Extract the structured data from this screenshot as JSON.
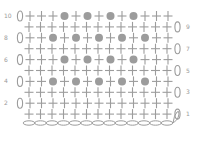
{
  "chart_data": {
    "type": "crochet-chart",
    "stitch_color": "#9c9c9c",
    "symbols": {
      "+": "single-crochet",
      "o": "bobble",
      "0": "chain",
      "c": "foundation-chain"
    },
    "rows": [
      {
        "number": "10",
        "label_side": "left",
        "turning_chain": "left",
        "stitches": "+++o+o+o+o+++"
      },
      {
        "number": "9",
        "label_side": "right",
        "turning_chain": "right",
        "stitches": "+++++++++++++"
      },
      {
        "number": "8",
        "label_side": "left",
        "turning_chain": "left",
        "stitches": "++o+o+o+o+o++"
      },
      {
        "number": "7",
        "label_side": "right",
        "turning_chain": "right",
        "stitches": "+++++++++++++"
      },
      {
        "number": "6",
        "label_side": "left",
        "turning_chain": "left",
        "stitches": "+++o+o+o+o+++"
      },
      {
        "number": "5",
        "label_side": "right",
        "turning_chain": "right",
        "stitches": "+++++++++++++"
      },
      {
        "number": "4",
        "label_side": "left",
        "turning_chain": "left",
        "stitches": "++o+o+o+o+o++"
      },
      {
        "number": "3",
        "label_side": "right",
        "turning_chain": "right",
        "stitches": "+++++++++++++"
      },
      {
        "number": "2",
        "label_side": "left",
        "turning_chain": "left",
        "stitches": "+++++++++++++"
      },
      {
        "number": "1",
        "label_side": "right",
        "turning_chain": "right",
        "stitches": "+++++++++++++"
      }
    ],
    "foundation_chain_count": 13
  }
}
